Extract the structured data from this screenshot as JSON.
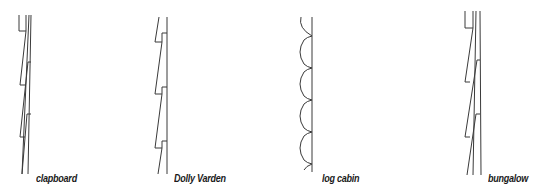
{
  "diagram": {
    "type": "siding profiles",
    "profiles": [
      {
        "id": "clapboard",
        "label": "clapboard"
      },
      {
        "id": "dolly-varden",
        "label": "Dolly Varden"
      },
      {
        "id": "log-cabin",
        "label": "log cabin"
      },
      {
        "id": "bungalow",
        "label": "bungalow"
      }
    ],
    "colors": {
      "line": "#3a3a3a",
      "text": "#1a1a1a",
      "background": "#ffffff"
    }
  }
}
